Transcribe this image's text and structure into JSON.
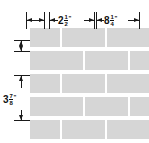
{
  "figure": {
    "brick_fill_color": "#d6d6d6",
    "mortar_color": "#ffffff",
    "line_color": "#1a1a1a",
    "background_color": "#ffffff"
  },
  "dimensions": {
    "joint": {
      "label": "",
      "whole": "",
      "numerator": "",
      "denominator": "",
      "unit": "",
      "description": "mortar joint width, unlabeled"
    },
    "short_brick": {
      "whole": "2",
      "numerator": "1",
      "denominator": "2",
      "unit": "\"",
      "text": "2 1/2\""
    },
    "long_brick": {
      "whole": "8",
      "numerator": "1",
      "denominator": "4",
      "unit": "\"",
      "text": "8 1/4\""
    },
    "brick_height": {
      "whole": "3",
      "numerator": "7",
      "denominator": "8",
      "unit": "\"",
      "text": "3 7/8\""
    }
  },
  "wall": {
    "rows": [
      {
        "index": 0,
        "top": 0,
        "bricks": [
          {
            "left": 0,
            "width": 30
          },
          {
            "left": 32,
            "width": 43
          },
          {
            "left": 77,
            "width": 43
          },
          {
            "left": 122,
            "width": 30
          }
        ]
      },
      {
        "index": 1,
        "top": 23,
        "bricks": [
          {
            "left": 0,
            "width": 53
          },
          {
            "left": 55,
            "width": 43
          },
          {
            "left": 100,
            "width": 43
          }
        ]
      },
      {
        "index": 2,
        "top": 46,
        "bricks": [
          {
            "left": 0,
            "width": 30
          },
          {
            "left": 32,
            "width": 43
          },
          {
            "left": 77,
            "width": 43
          },
          {
            "left": 122,
            "width": 30
          }
        ]
      },
      {
        "index": 3,
        "top": 69,
        "bricks": [
          {
            "left": 0,
            "width": 53
          },
          {
            "left": 55,
            "width": 43
          },
          {
            "left": 100,
            "width": 43
          }
        ]
      },
      {
        "index": 4,
        "top": 92,
        "bricks": [
          {
            "left": 0,
            "width": 30
          },
          {
            "left": 32,
            "width": 43
          },
          {
            "left": 77,
            "width": 43
          },
          {
            "left": 122,
            "width": 30
          }
        ]
      }
    ]
  }
}
